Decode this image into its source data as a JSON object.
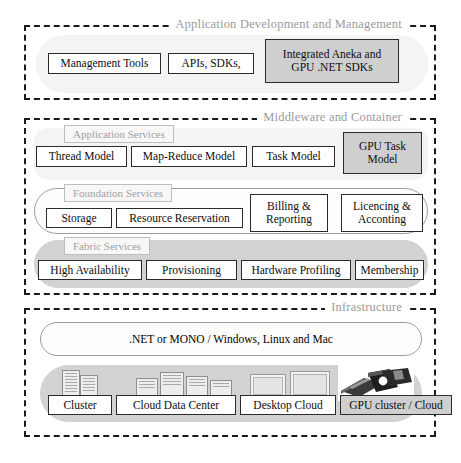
{
  "diagram": {
    "palette": {
      "highlight_fill": "#cfcfcf",
      "pill_gray": "#d2d2d2",
      "pill_white": "#fdfdfd",
      "section_title_color": "#9a9a9a",
      "border": "#1a1a1a"
    }
  },
  "sections": [
    {
      "id": "application-development-and-management",
      "title": "Application Development and Management",
      "items": [
        {
          "label": "Management Tools",
          "highlighted": false
        },
        {
          "label": "APIs, SDKs,",
          "highlighted": false
        },
        {
          "label": "Integrated Aneka and GPU .NET SDKs",
          "line1": "Integrated Aneka and",
          "line2": "GPU .NET SDKs",
          "highlighted": true
        }
      ]
    },
    {
      "id": "middleware-and-container",
      "title": "Middleware and Container",
      "bands": [
        {
          "id": "application-services",
          "label": "Application Services",
          "fill": "ghost",
          "items": [
            {
              "label": "Thread Model",
              "highlighted": false
            },
            {
              "label": "Map-Reduce Model",
              "highlighted": false
            },
            {
              "label": "Task Model",
              "highlighted": false
            },
            {
              "label": "GPU Task Model",
              "line1": "GPU Task",
              "line2": "Model",
              "highlighted": true
            }
          ]
        },
        {
          "id": "foundation-services",
          "label": "Foundation Services",
          "fill": "white",
          "items": [
            {
              "label": "Storage",
              "highlighted": false
            },
            {
              "label": "Resource Reservation",
              "highlighted": false
            },
            {
              "label": "Billing & Reporting",
              "line1": "Billing &",
              "line2": "Reporting",
              "highlighted": false
            },
            {
              "label": "Licencing & Acconting",
              "line1": "Licencing &",
              "line2": "Acconting",
              "highlighted": false
            }
          ]
        },
        {
          "id": "fabric-services",
          "label": "Fabric Services",
          "fill": "gray",
          "items": [
            {
              "label": "High Availability",
              "highlighted": false
            },
            {
              "label": "Provisioning",
              "highlighted": false
            },
            {
              "label": "Hardware Profiling",
              "highlighted": false
            },
            {
              "label": "Membership",
              "highlighted": false
            }
          ]
        }
      ]
    },
    {
      "id": "infrastructure",
      "title": "Infrastructure",
      "platform_band": {
        "label": ".NET or MONO / Windows, Linux and Mac"
      },
      "resource_band": {
        "items": [
          {
            "label": "Cluster",
            "icon": "server-rack-icon",
            "highlighted": false
          },
          {
            "label": "Cloud Data Center",
            "icon": "data-center-icon",
            "highlighted": false
          },
          {
            "label": "Desktop Cloud",
            "icon": "desktop-monitors-icon",
            "highlighted": false
          },
          {
            "label": "GPU cluster / Cloud",
            "icon": "gpu-card-icon",
            "highlighted": true
          }
        ]
      }
    }
  ]
}
